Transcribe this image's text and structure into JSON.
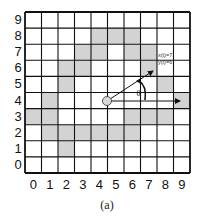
{
  "figure": {
    "caption": "(a)",
    "grid": {
      "cols": 10,
      "rows": 10,
      "x_tick_labels": [
        "0",
        "1",
        "2",
        "3",
        "4",
        "5",
        "6",
        "7",
        "8",
        "9"
      ],
      "y_tick_labels": [
        "9",
        "8",
        "7",
        "6",
        "5",
        "4",
        "3",
        "2",
        "1",
        "0"
      ],
      "occupied_color": "#d3d3d3",
      "free_color": "#ffffff",
      "line_color": "#111111",
      "occupied_cells": [
        [
          4,
          8
        ],
        [
          5,
          8
        ],
        [
          6,
          8
        ],
        [
          3,
          7
        ],
        [
          4,
          7
        ],
        [
          6,
          7
        ],
        [
          7,
          7
        ],
        [
          2,
          6
        ],
        [
          3,
          6
        ],
        [
          7,
          6
        ],
        [
          2,
          5
        ],
        [
          8,
          5
        ],
        [
          1,
          4
        ],
        [
          9,
          4
        ],
        [
          0,
          3
        ],
        [
          1,
          3
        ],
        [
          6,
          3
        ],
        [
          7,
          3
        ],
        [
          8,
          3
        ],
        [
          1,
          2
        ],
        [
          2,
          2
        ],
        [
          3,
          2
        ],
        [
          4,
          2
        ],
        [
          5,
          2
        ],
        [
          6,
          2
        ],
        [
          2,
          1
        ]
      ]
    },
    "robot": {
      "position_label": "robot",
      "x": 4.5,
      "y": 4.5,
      "fill": "#d9d9d9"
    },
    "pose": {
      "x_label": "x(t)=7",
      "y_label": "y(t)=6",
      "angle_symbol": "θ"
    }
  }
}
